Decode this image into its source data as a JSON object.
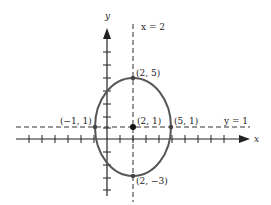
{
  "diagram": {
    "type": "ellipse-graph",
    "axes": {
      "x_label": "x",
      "y_label": "y"
    },
    "lines": [
      {
        "label": "x = 2",
        "kind": "vertical-dashed"
      },
      {
        "label": "y = 1",
        "kind": "horizontal-dashed"
      }
    ],
    "ellipse": {
      "center": [
        2,
        1
      ],
      "a": 3,
      "b": 4
    },
    "points": [
      {
        "label": "(2, 5)",
        "x": 2,
        "y": 5
      },
      {
        "label": "(2, 1)",
        "x": 2,
        "y": 1,
        "center": true
      },
      {
        "label": "(5, 1)",
        "x": 5,
        "y": 1
      },
      {
        "label": "(−1, 1)",
        "x": -1,
        "y": 1
      },
      {
        "label": "(2, −3)",
        "x": 2,
        "y": -3
      }
    ]
  }
}
